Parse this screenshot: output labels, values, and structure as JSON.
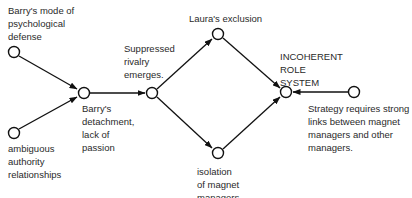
{
  "diagram": {
    "nodes": [
      {
        "id": "mode",
        "label": "Barry's mode of\npsychological\ndefense",
        "x": 14,
        "y": 52
      },
      {
        "id": "authority",
        "label": "ambiguous\nauthority\nrelationships",
        "x": 14,
        "y": 133
      },
      {
        "id": "detachment",
        "label": "Barry's\ndetachment,\nlack of\npassion",
        "x": 84,
        "y": 93
      },
      {
        "id": "rivalry",
        "label": "Suppressed\nrivalry\nemerges.",
        "x": 152,
        "y": 93
      },
      {
        "id": "laura",
        "label": "Laura's exclusion",
        "x": 218,
        "y": 34
      },
      {
        "id": "isolation",
        "label": "isolation\nof magnet\nmanagers",
        "x": 218,
        "y": 153
      },
      {
        "id": "incoherent",
        "label": "INCOHERENT\nROLE\nSYSTEM",
        "x": 286,
        "y": 92
      },
      {
        "id": "strategy",
        "label": "Strategy requires strong\nlinks between magnet\nmanagers and other\nmanagers.",
        "x": 354,
        "y": 92
      }
    ],
    "edges": [
      {
        "from": "mode",
        "to": "detachment"
      },
      {
        "from": "authority",
        "to": "detachment"
      },
      {
        "from": "detachment",
        "to": "rivalry"
      },
      {
        "from": "rivalry",
        "to": "laura"
      },
      {
        "from": "rivalry",
        "to": "isolation"
      },
      {
        "from": "laura",
        "to": "incoherent"
      },
      {
        "from": "isolation",
        "to": "incoherent"
      },
      {
        "from": "strategy",
        "to": "incoherent"
      }
    ]
  }
}
